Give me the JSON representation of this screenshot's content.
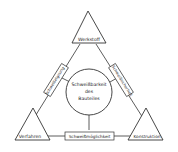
{
  "diagram": {
    "title": "Schweißbarkeit des Bauteiles",
    "center": {
      "lines": [
        "Schweißbarkeit",
        "des",
        "Bauteiles"
      ]
    },
    "corners": {
      "top": "Werkstoff",
      "left": "Verfahren",
      "right": "Konstruktion"
    },
    "edges": {
      "left": "Schweißeignung",
      "right": "Schweißsicherheit",
      "bottom": "Schweißmöglichkeit"
    }
  }
}
